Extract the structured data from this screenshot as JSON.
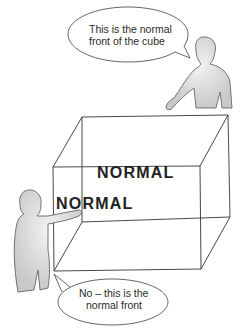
{
  "figure": {
    "cube": {
      "back_face_label": "NORMAL",
      "front_face_label": "NORMAL",
      "line_color": "#333333"
    },
    "speech_bubbles": [
      {
        "speaker": "top-right-person",
        "lines": [
          "This is the normal",
          "front of the cube"
        ]
      },
      {
        "speaker": "bottom-left-person",
        "lines": [
          "No – this is the",
          "normal front"
        ]
      }
    ],
    "colors": {
      "background": "#ffffff",
      "figure_fill": "#d9d9d9",
      "outline": "#444444"
    }
  }
}
